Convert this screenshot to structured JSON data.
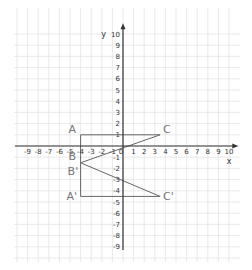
{
  "chart_data": {
    "type": "line",
    "title": "",
    "xlabel": "x",
    "ylabel": "y",
    "xlim": [
      -9,
      10
    ],
    "ylim": [
      -9,
      10
    ],
    "grid": true,
    "x_ticks": [
      "-9",
      "-8",
      "-7",
      "-6",
      "-5",
      "-4",
      "-3",
      "-2",
      "-1",
      "0",
      "1",
      "2",
      "3",
      "4",
      "5",
      "6",
      "7",
      "8",
      "9",
      "10"
    ],
    "y_ticks": [
      "10",
      "9",
      "8",
      "7",
      "6",
      "5",
      "4",
      "3",
      "2",
      "1",
      "-1",
      "-2",
      "-3",
      "-4",
      "-5",
      "-6",
      "-7",
      "-8",
      "-9"
    ],
    "points": [
      {
        "label": "A",
        "x": -4,
        "y": 1
      },
      {
        "label": "C",
        "x": 3.5,
        "y": 1
      },
      {
        "label": "B",
        "x": -4,
        "y": -1.5
      },
      {
        "label": "B'",
        "x": -4,
        "y": -1.5
      },
      {
        "label": "A'",
        "x": -4,
        "y": -4.5
      },
      {
        "label": "C'",
        "x": 3.5,
        "y": -4.5
      }
    ],
    "series": [
      {
        "name": "triangle ABC",
        "segments": [
          [
            -4,
            1,
            3.5,
            1
          ],
          [
            -4,
            1,
            -4,
            -1.5
          ],
          [
            -4,
            -1.5,
            3.5,
            1
          ]
        ]
      },
      {
        "name": "triangle A'B'C'",
        "segments": [
          [
            -4,
            -4.5,
            3.5,
            -4.5
          ],
          [
            -4,
            -4.5,
            -4,
            -1.5
          ],
          [
            -4,
            -1.5,
            3.5,
            -4.5
          ]
        ]
      }
    ]
  },
  "colors": {
    "grid": "#e3e3e3",
    "axis": "#333333",
    "shape": "#666666",
    "label": "#777777"
  }
}
